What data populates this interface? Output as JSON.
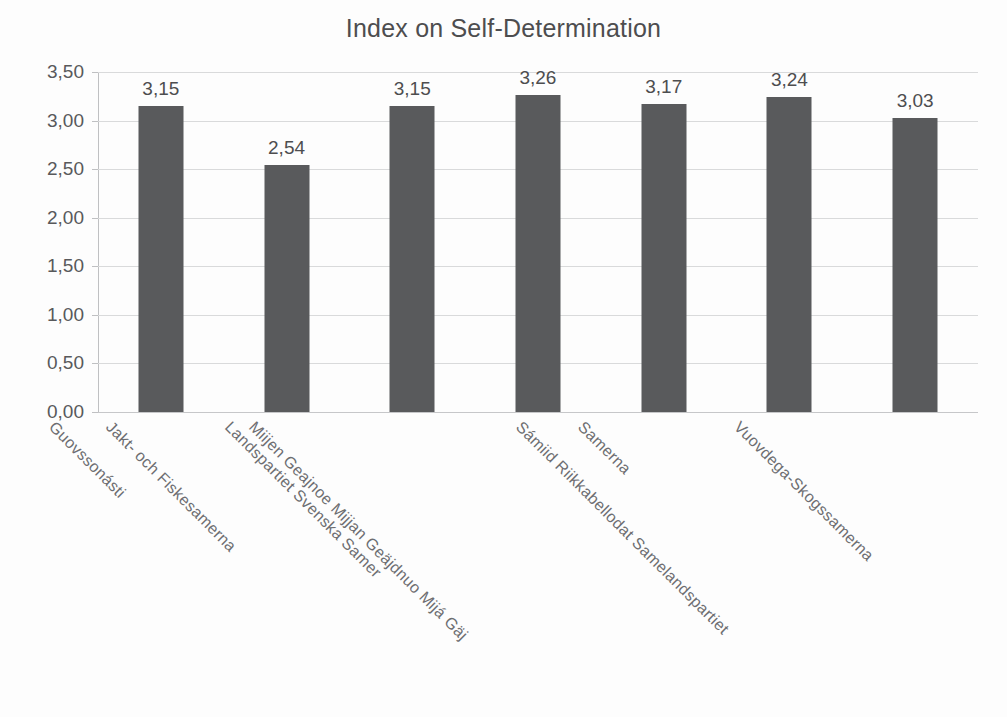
{
  "chart_data": {
    "type": "bar",
    "title": "Index on Self-Determination",
    "xlabel": "",
    "ylabel": "",
    "ylim": [
      0,
      3.5
    ],
    "ytick_labels": [
      "3,50",
      "3,00",
      "2,50",
      "2,00",
      "1,50",
      "1,00",
      "0,50",
      "0,00"
    ],
    "ytick_values": [
      3.5,
      3.0,
      2.5,
      2.0,
      1.5,
      1.0,
      0.5,
      0.0
    ],
    "grid": true,
    "legend": false,
    "decimal_separator": ",",
    "bar_color": "#595a5c",
    "categories": [
      "Guovssonásti",
      "Jakt- och Fiskesamerna",
      "Landspartiet Svenska Samer",
      "Miijen Geajnoe Mijjan Geäjdnuo Mijá Gäj",
      "Samerna",
      "Sámiid Riikkabellodat Samelandspartiet",
      "Vuovdega-Skogssamerna"
    ],
    "values": [
      3.15,
      2.54,
      3.15,
      3.26,
      3.17,
      3.24,
      3.03
    ],
    "value_labels": [
      "3,15",
      "2,54",
      "3,15",
      "3,26",
      "3,17",
      "3,24",
      "3,03"
    ]
  }
}
